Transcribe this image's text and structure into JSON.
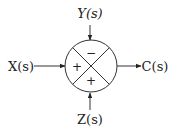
{
  "diagram": {
    "type": "summing-junction",
    "inputs": {
      "top": {
        "label": "Y(s)",
        "sign": "−"
      },
      "left": {
        "label": "X(s)",
        "sign": "+"
      },
      "bottom": {
        "label": "Z(s)",
        "sign": "+"
      }
    },
    "output": {
      "label": "C(s)"
    }
  }
}
